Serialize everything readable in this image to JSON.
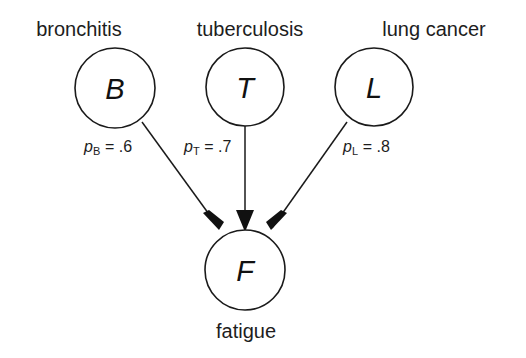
{
  "diagram": {
    "type": "causal-bayesian-network",
    "background_color": "#ffffff",
    "line_color": "#1a1a1a",
    "nodes": [
      {
        "id": "B",
        "letter": "B",
        "label": "bronchitis",
        "cx": 115,
        "cy": 88,
        "r": 40
      },
      {
        "id": "T",
        "letter": "T",
        "label": "tuberculosis",
        "cx": 245,
        "cy": 87,
        "r": 39
      },
      {
        "id": "L",
        "letter": "L",
        "label": "lung cancer",
        "cx": 374,
        "cy": 87,
        "r": 39
      },
      {
        "id": "F",
        "letter": "F",
        "label": "fatigue",
        "cx": 245,
        "cy": 270,
        "r": 40
      }
    ],
    "edges": [
      {
        "from": "B",
        "to": "F",
        "param_var": "p",
        "param_sub": "B",
        "param_eq": " = .6",
        "label_text": "p_B = .6",
        "label_x": 84,
        "label_y": 139
      },
      {
        "from": "T",
        "to": "F",
        "param_var": "p",
        "param_sub": "T",
        "param_eq": " = .7",
        "label_text": "p_T = .7",
        "label_x": 184,
        "label_y": 139
      },
      {
        "from": "L",
        "to": "F",
        "param_var": "p",
        "param_sub": "L",
        "param_eq": " = .8",
        "label_text": "p_L = .8",
        "label_x": 343,
        "label_y": 139
      }
    ]
  }
}
